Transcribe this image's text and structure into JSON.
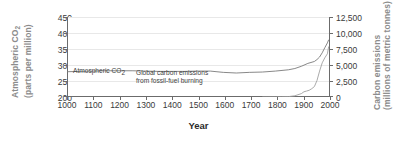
{
  "chart_data": {
    "type": "line",
    "title": "",
    "xlabel": "Year",
    "xlim": [
      1000,
      2010
    ],
    "xticks": [
      "1000",
      "1100",
      "1200",
      "1300",
      "1400",
      "1500",
      "1600",
      "1700",
      "1800",
      "1900",
      "2000"
    ],
    "grid": true,
    "legend_position": "in-plot annotations",
    "axes": {
      "left": {
        "label_line1": "Atmospheric CO",
        "label_sub1": "2",
        "label_line2": "(parts per million)",
        "ticks": [
          "200",
          "250",
          "300",
          "350",
          "400",
          "450"
        ],
        "ylim": [
          200,
          450
        ]
      },
      "right": {
        "label_line1": "Carbon emissions",
        "label_line2": "(millions of metric tonnes)",
        "ticks": [
          "0",
          "2,500",
          "5,000",
          "7,500",
          "10,000",
          "12,500"
        ],
        "ylim": [
          0,
          12500
        ]
      }
    },
    "annotations": [
      {
        "text_line1": "Atmospheric CO",
        "sub": "2",
        "text_line2": ""
      },
      {
        "text_line1": "Global carbon emissions",
        "text_line2": "from fossil-fuel burning"
      }
    ],
    "series": [
      {
        "name": "Atmospheric CO2",
        "axis": "left",
        "unit": "parts per million",
        "x": [
          1000,
          1050,
          1100,
          1150,
          1200,
          1250,
          1300,
          1350,
          1400,
          1450,
          1500,
          1550,
          1600,
          1650,
          1700,
          1750,
          1800,
          1850,
          1875,
          1900,
          1925,
          1950,
          1960,
          1970,
          1980,
          1990,
          2000,
          2005
        ],
        "values": [
          279,
          280,
          281,
          282,
          282,
          282,
          281,
          280,
          280,
          280,
          281,
          281,
          277,
          275,
          277,
          278,
          281,
          285,
          289,
          296,
          305,
          311,
          317,
          325,
          338,
          354,
          369,
          379
        ]
      },
      {
        "name": "Global carbon emissions from fossil-fuel burning",
        "axis": "right",
        "unit": "millions of metric tonnes",
        "x": [
          1750,
          1800,
          1825,
          1850,
          1875,
          1900,
          1910,
          1920,
          1930,
          1940,
          1950,
          1960,
          1970,
          1980,
          1990,
          2000,
          2005
        ],
        "values": [
          0,
          10,
          30,
          60,
          190,
          530,
          820,
          930,
          1050,
          1300,
          1630,
          2570,
          4050,
          5330,
          6120,
          6750,
          7900
        ]
      }
    ]
  },
  "colors": {
    "axis": "#6b6b6b",
    "gridline": "#e8e8e8",
    "axis_title": "#8c8c8c",
    "tick_text": "#3a3a3a",
    "curve_co2": "#7a7a7a",
    "curve_emissions": "#9a9a9a",
    "background": "#ffffff"
  }
}
